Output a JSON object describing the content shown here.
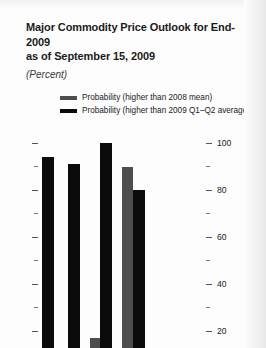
{
  "chart_data": {
    "type": "bar",
    "title": "Major Commodity Price Outlook for End-2009 as of September 15, 2009",
    "title_line1": "Major Commodity Price Outlook for End-2009",
    "title_line2": "as of September 15, 2009",
    "subtitle": "(Percent)",
    "xlabel": "",
    "ylabel": "",
    "ylim": [
      0,
      100
    ],
    "grid": false,
    "legend_position": "top-center",
    "axis_side": "right",
    "note": "Chart is cropped at the bottom edge of the screenshot; category labels below the axis are not visible.",
    "tick_labels": [
      "100",
      "80",
      "60",
      "40",
      "20"
    ],
    "tick_values": [
      100,
      80,
      60,
      40,
      20
    ],
    "minor_tick_values": [
      90,
      70,
      50,
      30
    ],
    "series": [
      {
        "name": "Probability (higher than 2008 mean)",
        "color": "#4d4d4d",
        "values": [
          null,
          null,
          17,
          90
        ]
      },
      {
        "name": "Probability (higher than 2009 Q1–Q2 average)",
        "color": "#0b0b0b",
        "values": [
          94,
          91,
          100,
          80
        ]
      }
    ],
    "categories": [
      "1",
      "2",
      "3",
      "4"
    ]
  },
  "legend": {
    "items": [
      {
        "label": "Probability (higher than 2008 mean)",
        "color": "#4d4d4d"
      },
      {
        "label": "Probability (higher than 2009 Q1–Q2 average)",
        "color": "#0b0b0b"
      }
    ]
  },
  "axis": {
    "ticks": [
      {
        "label": "100",
        "value": 100,
        "minor": false
      },
      {
        "label": "",
        "value": 90,
        "minor": true
      },
      {
        "label": "80",
        "value": 80,
        "minor": false
      },
      {
        "label": "",
        "value": 70,
        "minor": true
      },
      {
        "label": "60",
        "value": 60,
        "minor": false
      },
      {
        "label": "",
        "value": 50,
        "minor": true
      },
      {
        "label": "40",
        "value": 40,
        "minor": false
      },
      {
        "label": "",
        "value": 30,
        "minor": true
      },
      {
        "label": "20",
        "value": 20,
        "minor": false
      }
    ]
  }
}
